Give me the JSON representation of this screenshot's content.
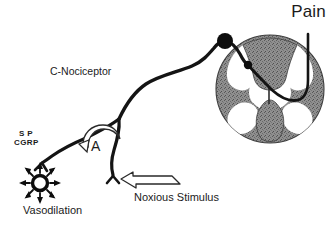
{
  "figure": {
    "background_color": "#ffffff",
    "ink_color": "#141414"
  },
  "labels": {
    "pain": "Pain",
    "c_nociceptor": "C-Nociceptor",
    "neuropeptide_line1": "S P",
    "neuropeptide_line2": "CGRP",
    "axon_reflex": "A",
    "vasodilation": "Vasodilation",
    "noxious_stimulus": "Noxious Stimulus"
  },
  "structures": {
    "drg_cell_body": {
      "name": "dorsal-root-ganglion-cell-body",
      "shape": "filled-circle",
      "color": "#0d0d0d",
      "cx": 225,
      "cy": 41,
      "r": 8
    },
    "synapse_terminal": {
      "name": "dorsal-horn-synapse",
      "shape": "filled-circle",
      "color": "#0d0d0d",
      "cx": 248,
      "cy": 65,
      "r": 4
    },
    "spinal_cord": {
      "name": "spinal-cord-cross-section",
      "grey_matter_color": "#8d8d8d",
      "white_matter_color": "#ffffff",
      "cx": 270,
      "cy": 89,
      "r": 54
    },
    "vasodilation_symbol": {
      "name": "vasodilation-starburst",
      "shape": "ring-with-radiating-arrows",
      "arrow_count": 8,
      "cx": 40,
      "cy": 183,
      "ring_r": 8
    },
    "nerve_terminal": {
      "name": "free-nerve-ending",
      "shape": "branched-tip",
      "x": 113,
      "y": 176
    },
    "axon_bifurcation": {
      "name": "axon-bifurcation",
      "x": 119,
      "y": 119
    },
    "ascending_tract": {
      "name": "ascending-spinothalamic-tract",
      "direction": "upward"
    },
    "noxious_arrow": {
      "name": "noxious-stimulus-arrow",
      "style": "hollow-outline",
      "points_to": "free-nerve-ending"
    },
    "axon_reflex_arrow": {
      "name": "axon-reflex-curved-arrow",
      "style": "hollow-curved",
      "direction": "counterclockwise-toward-periphery"
    }
  }
}
